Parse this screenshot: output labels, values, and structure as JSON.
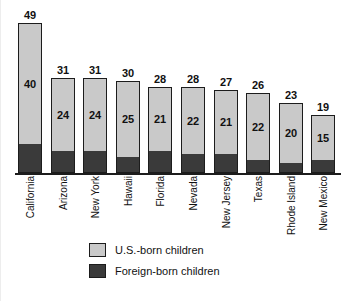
{
  "chart_data": {
    "type": "bar",
    "subtype": "stacked-bar",
    "title": "",
    "xlabel": "",
    "ylabel": "",
    "ylim": [
      0,
      49
    ],
    "grid": false,
    "legend_position": "bottom-left",
    "categories": [
      "California",
      "Arizona",
      "New York",
      "Hawaii",
      "Florida",
      "Nevada",
      "New Jersey",
      "Texas",
      "Rhode Island",
      "New Mexico"
    ],
    "series": [
      {
        "name": "U.S.-born children",
        "color": "#c9c9c9",
        "values": [
          40,
          24,
          24,
          25,
          21,
          22,
          21,
          22,
          20,
          15
        ]
      },
      {
        "name": "Foreign-born children",
        "color": "#3a3a3a",
        "values": [
          9,
          7,
          7,
          5,
          7,
          6,
          6,
          4,
          3,
          4
        ]
      }
    ],
    "totals": [
      49,
      31,
      31,
      30,
      28,
      28,
      27,
      26,
      23,
      19
    ],
    "total_labels": [
      "49",
      "31",
      "31",
      "30",
      "28",
      "28",
      "27",
      "26",
      "23",
      "19"
    ],
    "segment_labels": [
      "40",
      "24",
      "24",
      "25",
      "21",
      "22",
      "21",
      "22",
      "20",
      "15"
    ]
  },
  "legend": {
    "items": [
      {
        "label": "U.S.-born children",
        "swatch": "us"
      },
      {
        "label": "Foreign-born children",
        "swatch": "foreign"
      }
    ]
  },
  "colors": {
    "us_born": "#c9c9c9",
    "foreign_born": "#3a3a3a",
    "axis": "#1c1c1c",
    "background": "#ffffff",
    "text": "#111111"
  }
}
